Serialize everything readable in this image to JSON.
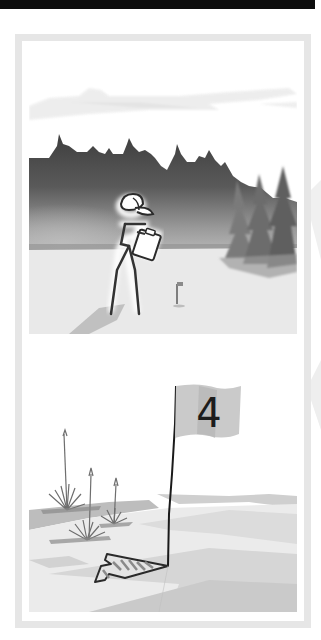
{
  "illustration": {
    "top_scene": {
      "description": "Stick figure wearing a cap holding a clipboard in a misty forest clearing with a small flag in the distance",
      "elements": [
        "clouds",
        "forest-silhouette",
        "pine-trees",
        "stick-figure",
        "clipboard",
        "distant-flag",
        "fairway"
      ]
    },
    "bottom_scene": {
      "description": "Golf flag marked with a number beside an arrowhead on a green with grass tufts",
      "flag_number": "4",
      "elements": [
        "flagstick",
        "flag",
        "arrowhead",
        "grass-tufts",
        "green"
      ]
    }
  },
  "colors": {
    "frame": "#e6e6e6",
    "top_bar": "#0d0d0d",
    "forest_dark": "#4a4a4a",
    "ground": "#e8e8e8",
    "flag": "#c9c9c9",
    "ink": "#222222"
  }
}
